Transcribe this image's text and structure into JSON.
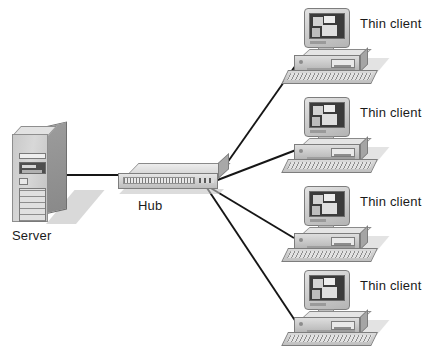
{
  "diagram": {
    "background_color": "#ffffff",
    "width": 432,
    "height": 353
  },
  "nodes": {
    "server": {
      "label": "Server",
      "type": "tower-server",
      "x": 10,
      "y": 126
    },
    "hub": {
      "label": "Hub",
      "type": "network-hub",
      "x": 118,
      "y": 163
    },
    "clients": [
      {
        "label": "Thin client",
        "type": "thin-client-workstation",
        "x": 288,
        "y": 8,
        "label_x": 360,
        "label_y": 16
      },
      {
        "label": "Thin client",
        "type": "thin-client-workstation",
        "x": 288,
        "y": 97,
        "label_x": 360,
        "label_y": 105
      },
      {
        "label": "Thin client",
        "type": "thin-client-workstation",
        "x": 288,
        "y": 186,
        "label_x": 360,
        "label_y": 194
      },
      {
        "label": "Thin client",
        "type": "thin-client-workstation",
        "x": 288,
        "y": 270,
        "label_x": 360,
        "label_y": 278
      }
    ]
  },
  "links": [
    {
      "from": "server",
      "to": "hub",
      "x1": 62,
      "y1": 175,
      "x2": 124,
      "y2": 175
    },
    {
      "from": "hub",
      "to": "client-1",
      "x1": 215,
      "y1": 180,
      "x2": 298,
      "y2": 62
    },
    {
      "from": "hub",
      "to": "client-2",
      "x1": 215,
      "y1": 181,
      "x2": 296,
      "y2": 150
    },
    {
      "from": "hub",
      "to": "client-3",
      "x1": 209,
      "y1": 187,
      "x2": 294,
      "y2": 238
    },
    {
      "from": "hub",
      "to": "client-4",
      "x1": 207,
      "y1": 188,
      "x2": 296,
      "y2": 322
    }
  ],
  "colors": {
    "line": "#161616",
    "text": "#1a1a1a",
    "device_light": "#e2e2e2",
    "device_mid": "#c2c2c2",
    "device_dark": "#8a8a8a",
    "screen": "#3b3b3b"
  }
}
